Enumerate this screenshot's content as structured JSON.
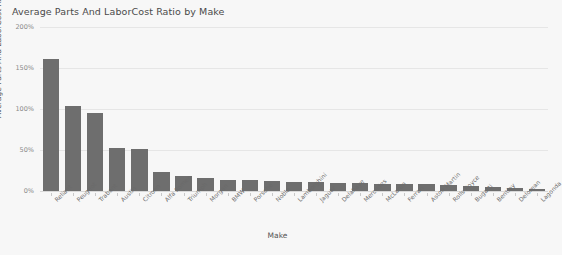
{
  "chart_data": {
    "type": "bar",
    "title": "Average Parts And LaborCost Ratio by Make",
    "xlabel": "Make",
    "ylabel": "Average Parts And LaborCost Ratio",
    "ylim": [
      0,
      200
    ],
    "ytick_labels": [
      "0%",
      "50%",
      "100%",
      "150%",
      "200%"
    ],
    "ytick_values": [
      0,
      50,
      100,
      150,
      200
    ],
    "grid": true,
    "legend": "none",
    "bar_color": "#6e6e6e",
    "background_color": "#f7f7f7",
    "categories": [
      "Reliant",
      "Peugeot",
      "Trabant",
      "Austin",
      "Citroen",
      "Alfa Romeo",
      "Triumph",
      "Morgan",
      "BMW",
      "Porsche",
      "Noble",
      "Lamborghini",
      "Jaguar",
      "Delahaye",
      "Mercedes",
      "McLaren",
      "Ferrari",
      "Aston Martin",
      "Rolls Royce",
      "Bugatti",
      "Bentley",
      "Delorean",
      "Lagonda"
    ],
    "values": [
      161,
      104,
      95,
      53,
      51,
      23,
      18,
      16,
      14,
      13,
      12,
      11,
      11,
      10,
      10,
      9,
      8,
      8,
      7,
      6,
      5,
      4,
      3
    ]
  }
}
